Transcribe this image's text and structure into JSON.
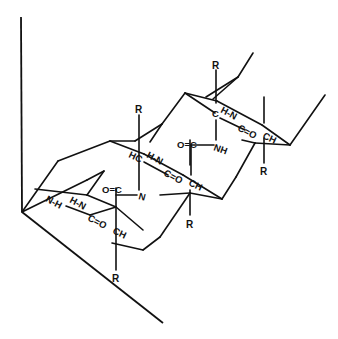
{
  "diagram": {
    "type": "chemical-structure",
    "labels": {
      "r_top_left": "R",
      "r_top_right": "R",
      "r_right": "R",
      "r_mid": "R",
      "r_bottom": "R",
      "hc_mid": "HC",
      "c_top": "C",
      "ch_right": "CH",
      "ch_mid": "CH",
      "ch_bottom": "CH",
      "hn_top": "H-N",
      "hn_mid": "H-N",
      "hn_bottom": "H-N",
      "nh_left": "N-H",
      "co_top": "C=O",
      "co_mid": "C=O",
      "co_bottom": "C=O",
      "oc_upper": "O=C",
      "oc_lower": "O=C",
      "nh_upper": "NH",
      "n_lower": "N"
    },
    "colors": {
      "ink": "#111111",
      "background": "#ffffff"
    }
  }
}
